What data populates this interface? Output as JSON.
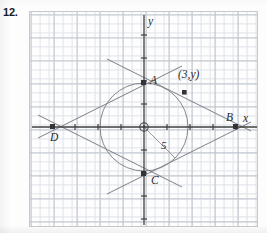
{
  "problem": {
    "number": "12."
  },
  "figure": {
    "type": "geometry-diagram",
    "axis_labels": {
      "x": "x",
      "y": "y"
    },
    "origin_marker": "circled-dot",
    "points": [
      {
        "id": "A",
        "label": "A",
        "x": 0,
        "y": 10,
        "marker": "square"
      },
      {
        "id": "B",
        "label": "B",
        "x": 20,
        "y": 0,
        "marker": "square"
      },
      {
        "id": "C",
        "label": "C",
        "x": 0,
        "y": -10,
        "marker": "square"
      },
      {
        "id": "D",
        "label": "D",
        "x": -20,
        "y": 0,
        "marker": "square"
      },
      {
        "id": "P",
        "label": "(3,y)",
        "x": 3,
        "y": 7,
        "marker": "square"
      }
    ],
    "circle": {
      "center_x": 0,
      "center_y": 0,
      "radius": 5,
      "radius_label": "5"
    },
    "grid": {
      "minor_spacing_units": 1,
      "major_spacing_units": 5,
      "ticks_visible": true
    },
    "colors": {
      "grid_minor": "#d8dde4",
      "grid_major": "#aab2bd",
      "axis": "#3a3a3a",
      "curve": "#7d7d82",
      "line": "#6f6f75",
      "point": "#3a3a3a",
      "text": "#2a2a2a",
      "frame": "#c9c9c9",
      "paper": "#ffffff"
    }
  }
}
